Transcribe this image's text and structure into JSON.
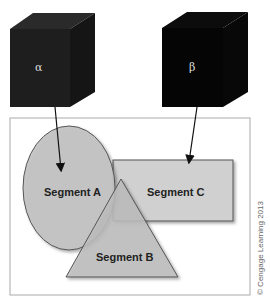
{
  "diagram": {
    "cubes": [
      {
        "id": "alpha",
        "label": "α"
      },
      {
        "id": "beta",
        "label": "β"
      }
    ],
    "segments": [
      {
        "id": "A",
        "label": "Segment A",
        "shape": "ellipse"
      },
      {
        "id": "B",
        "label": "Segment B",
        "shape": "triangle"
      },
      {
        "id": "C",
        "label": "Segment C",
        "shape": "rectangle"
      }
    ],
    "arrows": [
      {
        "from": "alpha",
        "to": "Segment A"
      },
      {
        "from": "beta",
        "to": "Segment C"
      }
    ],
    "copyright": "© Cengage Learning 2013"
  },
  "colors": {
    "cube": "#1a1a1a",
    "segment_fill": "#c8c8c8",
    "frame": "#aaaaaa"
  }
}
